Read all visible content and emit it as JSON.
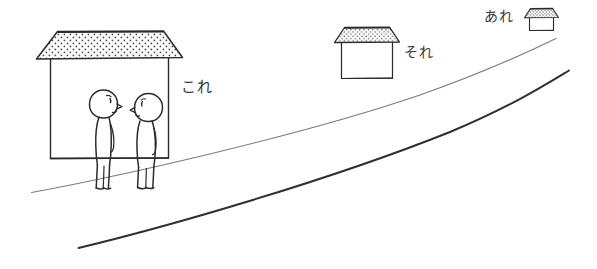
{
  "scene": {
    "title": "kore-sore-are perspective illustration",
    "width": 597,
    "height": 269,
    "background_color": "#ffffff",
    "ink_color": "#2b2b2b",
    "light_ink_color": "#6b6b6b",
    "text_color": "#3a3a3a",
    "roof_fill_color": "#fdfdfd"
  },
  "labels": {
    "near": {
      "text": "これ",
      "romaji_meaning": "kore",
      "points_to": "near-house",
      "x": 181,
      "y": 80
    },
    "mid": {
      "text": "それ",
      "romaji_meaning": "sore",
      "points_to": "mid-house",
      "x": 404,
      "y": 45
    },
    "far": {
      "text": "あれ",
      "romaji_meaning": "are",
      "points_to": "far-house",
      "x": 484,
      "y": 9
    }
  },
  "objects": {
    "near_house": {
      "name": "near-house",
      "size": "large",
      "roof_pattern": "stippled-dots"
    },
    "mid_house": {
      "name": "mid-house",
      "size": "medium",
      "roof_pattern": "stippled-dots"
    },
    "far_house": {
      "name": "far-house",
      "size": "small",
      "roof_pattern": "stippled-dots"
    },
    "figure_left": {
      "name": "stick-figure-left",
      "facing": "right"
    },
    "figure_right": {
      "name": "stick-figure-right",
      "facing": "left"
    },
    "road": {
      "name": "road",
      "description": "two converging perspective lines receding to the right"
    }
  }
}
